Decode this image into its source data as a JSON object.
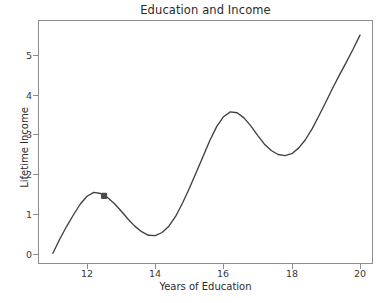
{
  "chart_data": {
    "type": "line",
    "title": "Education and Income",
    "xlabel": "Years of Education",
    "ylabel": "Lifetime Income",
    "xlim": [
      10.6,
      20.5
    ],
    "ylim": [
      -0.35,
      5.85
    ],
    "xticks": [
      12,
      14,
      16,
      18,
      20
    ],
    "yticks": [
      0,
      1,
      2,
      3,
      4,
      5
    ],
    "grid": false,
    "legend": null,
    "line_color": "#404040",
    "marker_color": "#4a4a4a",
    "series": [
      {
        "name": "Lifetime Income",
        "x": [
          11.0,
          11.2,
          11.4,
          11.6,
          11.8,
          12.0,
          12.2,
          12.4,
          12.6,
          12.8,
          13.0,
          13.2,
          13.4,
          13.6,
          13.8,
          14.0,
          14.2,
          14.4,
          14.6,
          14.8,
          15.0,
          15.2,
          15.4,
          15.6,
          15.8,
          16.0,
          16.2,
          16.4,
          16.6,
          16.8,
          17.0,
          17.2,
          17.4,
          17.6,
          17.8,
          18.0,
          18.2,
          18.4,
          18.6,
          18.8,
          19.0,
          19.2,
          19.4,
          19.6,
          19.8,
          20.0
        ],
        "y": [
          0.02,
          0.37,
          0.69,
          0.98,
          1.25,
          1.45,
          1.55,
          1.52,
          1.42,
          1.27,
          1.08,
          0.88,
          0.7,
          0.56,
          0.47,
          0.46,
          0.54,
          0.7,
          0.95,
          1.28,
          1.65,
          2.05,
          2.45,
          2.85,
          3.2,
          3.45,
          3.57,
          3.55,
          3.42,
          3.22,
          2.98,
          2.76,
          2.6,
          2.5,
          2.47,
          2.52,
          2.66,
          2.87,
          3.15,
          3.48,
          3.82,
          4.17,
          4.5,
          4.82,
          5.15,
          5.5
        ]
      }
    ],
    "markers": [
      {
        "label": "highlighted-point",
        "x": 12.5,
        "y": 1.46
      }
    ]
  },
  "ytick_labels": [
    "0",
    "1",
    "2",
    "3",
    "4",
    "5"
  ],
  "xtick_labels": [
    "12",
    "14",
    "16",
    "18",
    "20"
  ]
}
